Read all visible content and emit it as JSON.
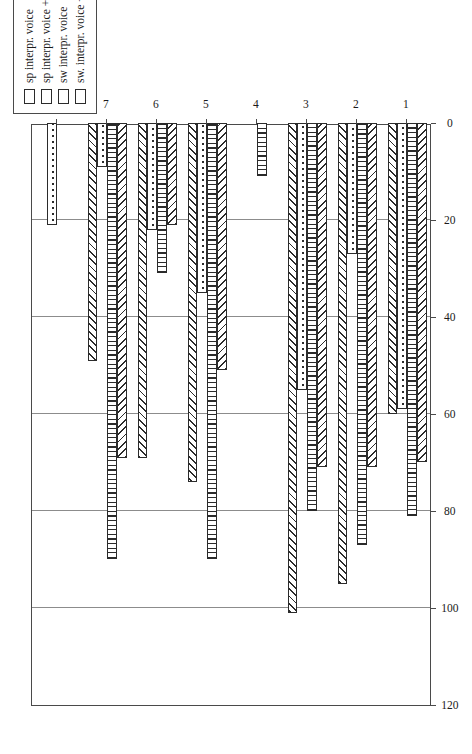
{
  "chart_data": {
    "type": "bar",
    "orientation": "horizontal",
    "title": "",
    "xlabel": "",
    "ylabel": "",
    "categories": [
      "1",
      "2",
      "3",
      "4",
      "5",
      "6",
      "7",
      "8"
    ],
    "value_axis": {
      "ticks": [
        0,
        20,
        40,
        60,
        80,
        100,
        120
      ],
      "lim": [
        0,
        120
      ],
      "grid": true,
      "direction": "right-to-left"
    },
    "legend": {
      "position": "top-left",
      "entries": [
        "sp interpr. voice",
        "sp interpr. voice + face",
        "sw interpr. voice",
        "sw. interpr. voice + face"
      ]
    },
    "series": [
      {
        "name": "sp interpr. voice",
        "pattern": "forward-diagonal-hatch",
        "values": [
          70,
          71,
          71,
          0,
          51,
          21,
          69,
          0
        ]
      },
      {
        "name": "sp interpr. voice + face",
        "pattern": "vertical-stripes",
        "values": [
          81,
          87,
          80,
          11,
          90,
          31,
          90,
          0
        ]
      },
      {
        "name": "sw interpr. voice",
        "pattern": "dots",
        "values": [
          59,
          27,
          55,
          0,
          35,
          22,
          9,
          21
        ]
      },
      {
        "name": "sw. interpr. voice + face",
        "pattern": "back-diagonal-hatch",
        "values": [
          60,
          95,
          101,
          0,
          74,
          69,
          49,
          0
        ]
      }
    ]
  }
}
